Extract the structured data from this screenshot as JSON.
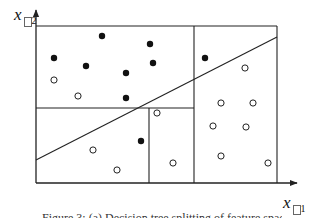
{
  "figure": {
    "y_axis_label": "x",
    "y_axis_subscript": "2",
    "x_axis_label": "x",
    "x_axis_subscript": "1",
    "caption_partial": "Figure 3:   (a) Decision tree splitting of feature space",
    "colors": {
      "stroke": "#222222",
      "filled_point": "#111111",
      "open_point_fill": "#ffffff",
      "background": "#ffffff"
    },
    "frame": {
      "left": 36,
      "top": 26,
      "right": 277,
      "bottom": 183
    },
    "partitions": [
      {
        "type": "vertical",
        "x": 194,
        "y1": 26,
        "y2": 183
      },
      {
        "type": "horizontal",
        "y": 108,
        "x1": 36,
        "x2": 194
      },
      {
        "type": "vertical",
        "x": 149,
        "y1": 108,
        "y2": 183
      }
    ],
    "decision_line": {
      "x1": 36,
      "y1": 160,
      "x2": 277,
      "y2": 37
    },
    "points": [
      {
        "x": 102,
        "y": 36,
        "class": "filled"
      },
      {
        "x": 150,
        "y": 44,
        "class": "filled"
      },
      {
        "x": 54,
        "y": 58,
        "class": "filled"
      },
      {
        "x": 86,
        "y": 66,
        "class": "filled"
      },
      {
        "x": 153,
        "y": 63,
        "class": "filled"
      },
      {
        "x": 126,
        "y": 73,
        "class": "filled"
      },
      {
        "x": 54,
        "y": 80,
        "class": "open"
      },
      {
        "x": 78,
        "y": 96,
        "class": "open"
      },
      {
        "x": 126,
        "y": 98,
        "class": "filled"
      },
      {
        "x": 205,
        "y": 58,
        "class": "filled"
      },
      {
        "x": 245,
        "y": 68,
        "class": "open"
      },
      {
        "x": 221,
        "y": 103,
        "class": "open"
      },
      {
        "x": 253,
        "y": 103,
        "class": "open"
      },
      {
        "x": 213,
        "y": 126,
        "class": "open"
      },
      {
        "x": 246,
        "y": 127,
        "class": "open"
      },
      {
        "x": 221,
        "y": 156,
        "class": "open"
      },
      {
        "x": 268,
        "y": 163,
        "class": "open"
      },
      {
        "x": 141,
        "y": 141,
        "class": "filled"
      },
      {
        "x": 93,
        "y": 150,
        "class": "open"
      },
      {
        "x": 117,
        "y": 170,
        "class": "open"
      },
      {
        "x": 157,
        "y": 113,
        "class": "open"
      },
      {
        "x": 173,
        "y": 163,
        "class": "open"
      }
    ]
  }
}
